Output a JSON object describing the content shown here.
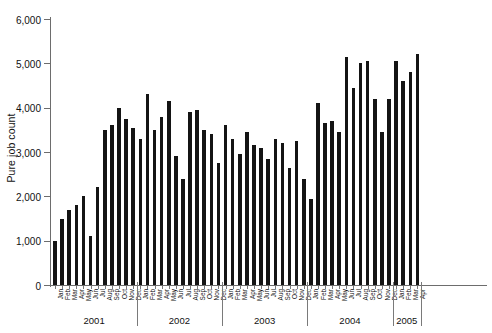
{
  "chart_data": {
    "type": "bar",
    "title": "",
    "xlabel": "",
    "ylabel": "Pure job count",
    "ylim": [
      0,
      6000
    ],
    "ytick_values": [
      0,
      1000,
      2000,
      3000,
      4000,
      5000,
      6000
    ],
    "ytick_labels": [
      "0",
      "1,000",
      "2,000",
      "3,000",
      "4,000",
      "5,000",
      "6,000"
    ],
    "grid": false,
    "legend": "none",
    "bar_color": "#141414",
    "axis_color": "#6d6d6d",
    "categories": [
      "Jan",
      "Feb",
      "Mar",
      "Apr",
      "May",
      "Jun",
      "Jul",
      "Aug",
      "Sep",
      "Oct",
      "Nov",
      "Dec",
      "Jan",
      "Feb",
      "Mar",
      "Apr",
      "May",
      "Jun",
      "Jul",
      "Aug",
      "Sep",
      "Oct",
      "Nov",
      "Dec",
      "Jan",
      "Feb",
      "Mar",
      "Apr",
      "May",
      "Jun",
      "Jul",
      "Aug",
      "Sep",
      "Oct",
      "Nov",
      "Dec",
      "Jan",
      "Feb",
      "Mar",
      "Apr",
      "May",
      "Jun",
      "Jul",
      "Aug",
      "Sep",
      "Oct",
      "Nov",
      "Dec",
      "Jan",
      "Feb",
      "Mar",
      "Apr"
    ],
    "values": [
      1000,
      1500,
      1700,
      1800,
      2000,
      1100,
      2200,
      3500,
      3600,
      4000,
      3750,
      3550,
      3300,
      4300,
      3500,
      3800,
      4150,
      2900,
      2400,
      3900,
      3950,
      3500,
      3400,
      2750,
      3600,
      3300,
      2950,
      3450,
      3150,
      3100,
      2850,
      3300,
      3200,
      2650,
      3250,
      2400,
      1950,
      4100,
      3650,
      3700,
      3450,
      5150,
      4450,
      5000,
      5050,
      4200,
      3450,
      4200,
      5050,
      4600,
      4800,
      5200
    ],
    "years": [
      {
        "label": "2001",
        "start_index": 0,
        "count": 12
      },
      {
        "label": "2002",
        "start_index": 12,
        "count": 12
      },
      {
        "label": "2003",
        "start_index": 24,
        "count": 12
      },
      {
        "label": "2004",
        "start_index": 36,
        "count": 12
      },
      {
        "label": "2005",
        "start_index": 48,
        "count": 4
      }
    ]
  }
}
